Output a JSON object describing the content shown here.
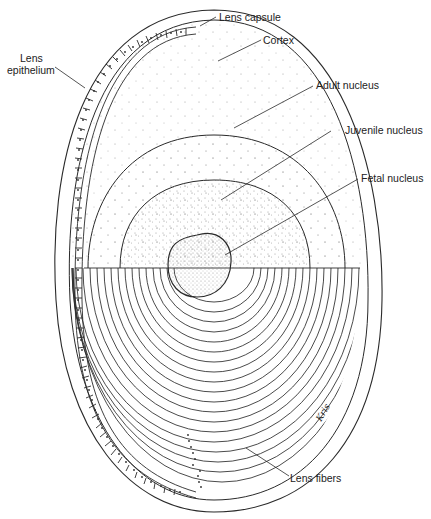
{
  "labels": {
    "lens_capsule": "Lens capsule",
    "cortex": "Cortex",
    "lens_epithelium_line1": "Lens",
    "lens_epithelium_line2": "epithelium",
    "adult_nucleus": "Adult nucleus",
    "juvenile_nucleus": "Juvenile nucleus",
    "fetal_nucleus": "Fetal nucleus",
    "lens_fibers": "Lens fibers"
  },
  "signature": "Kris",
  "colors": {
    "line": "#2a2a2a",
    "stipple": "#9a9a9a",
    "background": "#ffffff"
  }
}
